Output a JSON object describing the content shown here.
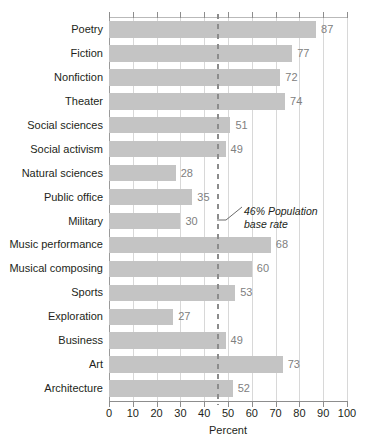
{
  "chart_data": {
    "type": "bar",
    "orientation": "horizontal",
    "title": "",
    "xlabel": "Percent",
    "ylabel": "",
    "xlim": [
      0,
      100
    ],
    "xticks": [
      0,
      10,
      20,
      30,
      40,
      50,
      60,
      70,
      80,
      90,
      100
    ],
    "xtick_labels": [
      "0",
      "10",
      "20",
      "30",
      "40",
      "50",
      "60",
      "70",
      "80",
      "90",
      "100"
    ],
    "grid": true,
    "legend": null,
    "categories": [
      "Poetry",
      "Fiction",
      "Nonfiction",
      "Theater",
      "Social sciences",
      "Social activism",
      "Natural sciences",
      "Public office",
      "Military",
      "Music performance",
      "Musical composing",
      "Sports",
      "Exploration",
      "Business",
      "Art",
      "Architecture"
    ],
    "values": [
      87,
      77,
      72,
      74,
      51,
      49,
      28,
      35,
      30,
      68,
      60,
      53,
      27,
      49,
      73,
      52
    ],
    "value_labels": [
      "87",
      "77",
      "72",
      "74",
      "51",
      "49",
      "28",
      "35",
      "30",
      "68",
      "60",
      "53",
      "27",
      "49",
      "73",
      "52"
    ],
    "reference_line": {
      "value": 46,
      "style": "dashed",
      "annotation_line1": "46% Population",
      "annotation_line2": "base rate"
    },
    "colors": {
      "bar": "#c4c4c4",
      "value_label": "#808080",
      "gridline": "#d8d8d8",
      "reference_line": "#8c8c8c",
      "text": "#231f20",
      "background": "#ffffff"
    }
  }
}
